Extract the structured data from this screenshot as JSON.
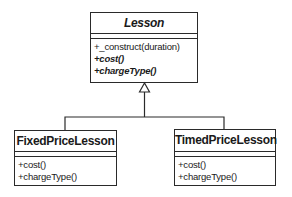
{
  "diagram": {
    "type": "uml-class-inheritance",
    "classes": [
      {
        "name": "Lesson",
        "abstract": true,
        "attributes": [],
        "operations": [
          {
            "label": "+_construct(duration)",
            "abstract": false
          },
          {
            "label": "+cost()",
            "abstract": true
          },
          {
            "label": "+chargeType()",
            "abstract": true
          }
        ]
      },
      {
        "name": "FixedPriceLesson",
        "abstract": false,
        "attributes": [],
        "operations": [
          {
            "label": "+cost()",
            "abstract": false
          },
          {
            "label": "+chargeType()",
            "abstract": false
          }
        ]
      },
      {
        "name": "TimedPriceLesson",
        "abstract": false,
        "attributes": [],
        "operations": [
          {
            "label": "+cost()",
            "abstract": false
          },
          {
            "label": "+chargeType()",
            "abstract": false
          }
        ]
      }
    ],
    "relationships": [
      {
        "type": "generalization",
        "from": "FixedPriceLesson",
        "to": "Lesson"
      },
      {
        "type": "generalization",
        "from": "TimedPriceLesson",
        "to": "Lesson"
      }
    ],
    "colors": {
      "stroke": "#2a2a2a",
      "background": "#ffffff"
    }
  }
}
